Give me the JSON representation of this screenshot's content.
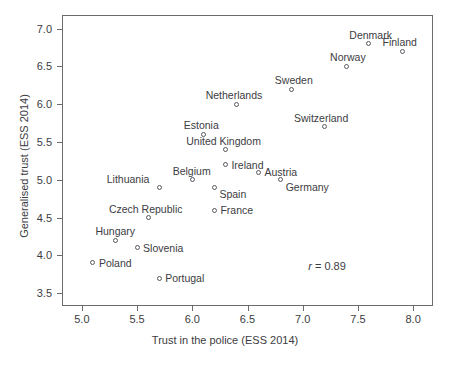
{
  "chart_data": {
    "type": "scatter",
    "title": "",
    "xlabel": "Trust in the police (ESS 2014)",
    "ylabel": "Generalised trust (ESS 2014)",
    "xlim": [
      4.82,
      8.18
    ],
    "ylim": [
      3.33,
      7.18
    ],
    "xticks": [
      "5.0",
      "5.5",
      "6.0",
      "6.5",
      "7.0",
      "7.5",
      "8.0"
    ],
    "xtick_values": [
      5.0,
      5.5,
      6.0,
      6.5,
      7.0,
      7.5,
      8.0
    ],
    "yticks": [
      "3.5",
      "4.0",
      "4.5",
      "5.0",
      "5.5",
      "6.0",
      "6.5",
      "7.0"
    ],
    "ytick_values": [
      3.5,
      4.0,
      4.5,
      5.0,
      5.5,
      6.0,
      6.5,
      7.0
    ],
    "grid": false,
    "legend": null,
    "marker": "open-circle",
    "annotations": [
      {
        "text": "r = 0.89",
        "x": 7.05,
        "y": 3.86,
        "italic_prefix": "r",
        "rest": " = 0.89"
      }
    ],
    "points": [
      {
        "label": "Denmark",
        "x": 7.6,
        "y": 6.8,
        "label_pos": "top"
      },
      {
        "label": "Finland",
        "x": 7.9,
        "y": 6.7,
        "label_pos": "top"
      },
      {
        "label": "Norway",
        "x": 7.4,
        "y": 6.5,
        "label_pos": "top"
      },
      {
        "label": "Sweden",
        "x": 6.9,
        "y": 6.2,
        "label_pos": "top"
      },
      {
        "label": "Netherlands",
        "x": 6.4,
        "y": 6.0,
        "label_pos": "top"
      },
      {
        "label": "Switzerland",
        "x": 7.2,
        "y": 5.7,
        "label_pos": "top"
      },
      {
        "label": "Estonia",
        "x": 6.1,
        "y": 5.6,
        "label_pos": "top"
      },
      {
        "label": "United Kingdom",
        "x": 6.3,
        "y": 5.4,
        "label_pos": "top"
      },
      {
        "label": "Ireland",
        "x": 6.3,
        "y": 5.2,
        "label_pos": "right"
      },
      {
        "label": "Austria",
        "x": 6.6,
        "y": 5.1,
        "label_pos": "right"
      },
      {
        "label": "Belgium",
        "x": 6.0,
        "y": 5.0,
        "label_pos": "top"
      },
      {
        "label": "Germany",
        "x": 6.8,
        "y": 5.0,
        "label_pos": "bottom-right"
      },
      {
        "label": "Lithuania",
        "x": 5.7,
        "y": 4.9,
        "label_pos": "top-left"
      },
      {
        "label": "Spain",
        "x": 6.2,
        "y": 4.9,
        "label_pos": "bottom-right"
      },
      {
        "label": "France",
        "x": 6.2,
        "y": 4.6,
        "label_pos": "right"
      },
      {
        "label": "Czech Republic",
        "x": 5.6,
        "y": 4.5,
        "label_pos": "top"
      },
      {
        "label": "Hungary",
        "x": 5.3,
        "y": 4.2,
        "label_pos": "top"
      },
      {
        "label": "Slovenia",
        "x": 5.5,
        "y": 4.1,
        "label_pos": "right"
      },
      {
        "label": "Poland",
        "x": 5.1,
        "y": 3.9,
        "label_pos": "right"
      },
      {
        "label": "Portugal",
        "x": 5.7,
        "y": 3.7,
        "label_pos": "right"
      }
    ]
  },
  "colors": {
    "marker_stroke": "#59595f",
    "text": "#3c3c42",
    "frame": "#6b6b6b",
    "background": "#ffffff"
  }
}
